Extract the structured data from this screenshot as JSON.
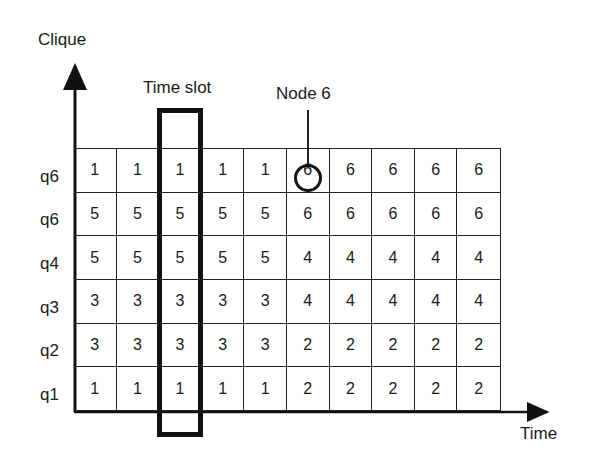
{
  "diagram": {
    "y_axis_label": "Clique",
    "x_axis_label": "Time",
    "time_slot_label": "Time slot",
    "node_annotation": "Node 6",
    "highlighted_time_slot_column": 3,
    "highlighted_cell": {
      "row": "q6",
      "row_index": 0,
      "column": 6,
      "value": "6"
    },
    "rows": [
      {
        "label": "q6",
        "values": [
          "1",
          "1",
          "1",
          "1",
          "1",
          "6",
          "6",
          "6",
          "6",
          "6"
        ]
      },
      {
        "label": "q6",
        "values": [
          "5",
          "5",
          "5",
          "5",
          "5",
          "6",
          "6",
          "6",
          "6",
          "6"
        ]
      },
      {
        "label": "q4",
        "values": [
          "5",
          "5",
          "5",
          "5",
          "5",
          "4",
          "4",
          "4",
          "4",
          "4"
        ]
      },
      {
        "label": "q3",
        "values": [
          "3",
          "3",
          "3",
          "3",
          "3",
          "4",
          "4",
          "4",
          "4",
          "4"
        ]
      },
      {
        "label": "q2",
        "values": [
          "3",
          "3",
          "3",
          "3",
          "3",
          "2",
          "2",
          "2",
          "2",
          "2"
        ]
      },
      {
        "label": "q1",
        "values": [
          "1",
          "1",
          "1",
          "1",
          "1",
          "2",
          "2",
          "2",
          "2",
          "2"
        ]
      }
    ]
  }
}
